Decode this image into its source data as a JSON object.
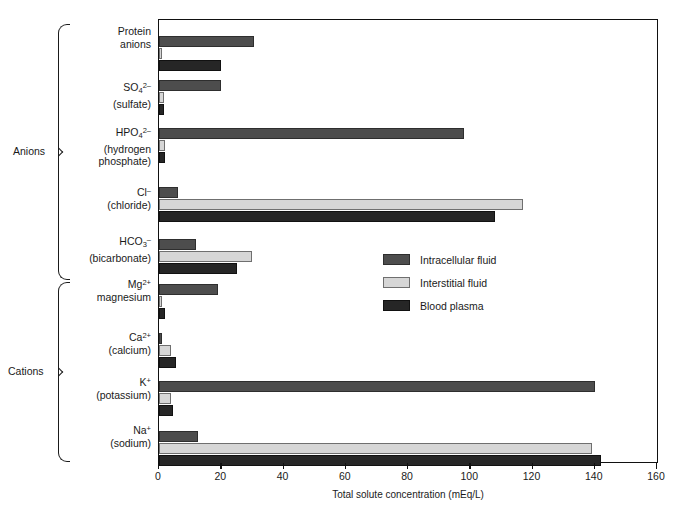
{
  "chart_data": {
    "type": "bar",
    "orientation": "horizontal",
    "title": "",
    "xlabel": "Total solute concentration (mEq/L)",
    "ylabel": "",
    "xlim": [
      0,
      160
    ],
    "xticks": [
      0,
      20,
      40,
      60,
      80,
      100,
      120,
      140,
      160
    ],
    "grid": false,
    "legend_position": "center-right",
    "categories": [
      "Protein anions",
      "SO4 2- (sulfate)",
      "HPO4 2- (hydrogen phosphate)",
      "Cl- (chloride)",
      "HCO3- (bicarbonate)",
      "Mg2+ magnesium",
      "Ca2+ (calcium)",
      "K+ (potassium)",
      "Na+ (sodium)"
    ],
    "series": [
      {
        "name": "Intracellular fluid",
        "color": "#4d4d4d",
        "values": [
          30.5,
          20,
          98,
          6,
          12,
          19,
          1,
          140,
          12.5
        ]
      },
      {
        "name": "Interstitial fluid",
        "color": "#d6d6d6",
        "values": [
          1,
          1.5,
          2,
          117,
          30,
          1,
          4,
          4,
          139
        ]
      },
      {
        "name": "Blood plasma",
        "color": "#262626",
        "values": [
          20,
          1.5,
          2,
          108,
          25,
          2,
          5.5,
          4.5,
          142
        ]
      }
    ]
  },
  "groups": [
    {
      "label": "Anions"
    },
    {
      "label": "Cations"
    }
  ],
  "category_labels": [
    {
      "line1": "Protein",
      "line2": "anions",
      "formula": null
    },
    {
      "line1": null,
      "line2": "(sulfate)",
      "formula": "SO4_2-"
    },
    {
      "line1": null,
      "line2": "(hydrogen",
      "line3": "phosphate)",
      "formula": "HPO4_2-"
    },
    {
      "line1": null,
      "line2": "(chloride)",
      "formula": "Cl_-"
    },
    {
      "line1": null,
      "line2": "(bicarbonate)",
      "formula": "HCO3_-"
    },
    {
      "line1": null,
      "line2": "magnesium",
      "formula": "Mg_2+"
    },
    {
      "line1": null,
      "line2": "(calcium)",
      "formula": "Ca_2+"
    },
    {
      "line1": null,
      "line2": "(potassium)",
      "formula": "K_+"
    },
    {
      "line1": null,
      "line2": "(sodium)",
      "formula": "Na_+"
    }
  ],
  "axis": {
    "title": "Total solute concentration (mEq/L)",
    "tick_labels": [
      "0",
      "20",
      "40",
      "60",
      "80",
      "100",
      "120",
      "140",
      "160"
    ]
  },
  "legend": {
    "items": [
      {
        "label": "Intracellular fluid",
        "color": "#4d4d4d"
      },
      {
        "label": "Interstitial fluid",
        "color": "#d6d6d6"
      },
      {
        "label": "Blood plasma",
        "color": "#262626"
      }
    ]
  }
}
